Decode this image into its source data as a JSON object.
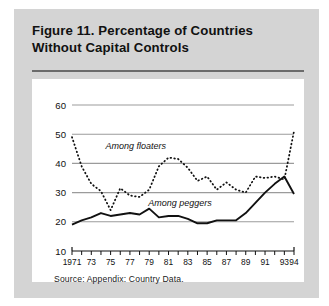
{
  "figure": {
    "title": "Figure 11.  Percentage of Countries Without Capital Controls",
    "title_line1": "Figure 11.  Percentage of Countries",
    "title_line2": "Without Capital Controls",
    "source": "Source:  Appendix:  Country Data."
  },
  "chart_data": {
    "type": "line",
    "title": "Figure 11. Percentage of Countries Without Capital Controls",
    "xlabel": "",
    "ylabel": "",
    "ylim": [
      10,
      60
    ],
    "xlim": [
      1971,
      1994
    ],
    "yticks": [
      10,
      20,
      30,
      40,
      50,
      60
    ],
    "ytick_labels": [
      "10",
      "20",
      "30",
      "40",
      "50",
      "60"
    ],
    "grid": true,
    "grid_axis": "y",
    "legend": "inline-annotations",
    "x": [
      1971,
      1972,
      1973,
      1974,
      1975,
      1976,
      1977,
      1978,
      1979,
      1980,
      1981,
      1982,
      1983,
      1984,
      1985,
      1986,
      1987,
      1988,
      1989,
      1990,
      1991,
      1992,
      1993,
      1994
    ],
    "xtick_labels": [
      "1971",
      "",
      "73",
      "",
      "75",
      "",
      "77",
      "",
      "79",
      "",
      "81",
      "",
      "83",
      "",
      "85",
      "",
      "87",
      "",
      "89",
      "",
      "91",
      "",
      "93",
      "94"
    ],
    "series": [
      {
        "name": "Among floaters",
        "style": "dashed",
        "color": "#111111",
        "label_x": 1977.6,
        "label_y": 45.0,
        "values": [
          49.0,
          39.0,
          33.0,
          30.5,
          24.0,
          31.5,
          29.0,
          28.5,
          31.0,
          39.0,
          42.0,
          41.5,
          38.5,
          34.0,
          35.5,
          31.0,
          33.5,
          31.0,
          30.0,
          35.5,
          35.0,
          35.5,
          34.5,
          51.0
        ]
      },
      {
        "name": "Among peggers",
        "style": "solid",
        "color": "#111111",
        "label_x": 1982.2,
        "label_y": 25.5,
        "values": [
          19.0,
          20.5,
          21.5,
          23.0,
          22.0,
          22.5,
          23.0,
          22.5,
          24.5,
          21.5,
          22.0,
          22.0,
          21.0,
          19.5,
          19.5,
          20.5,
          20.5,
          20.5,
          23.0,
          26.5,
          30.0,
          33.0,
          35.5,
          29.5
        ]
      }
    ]
  }
}
